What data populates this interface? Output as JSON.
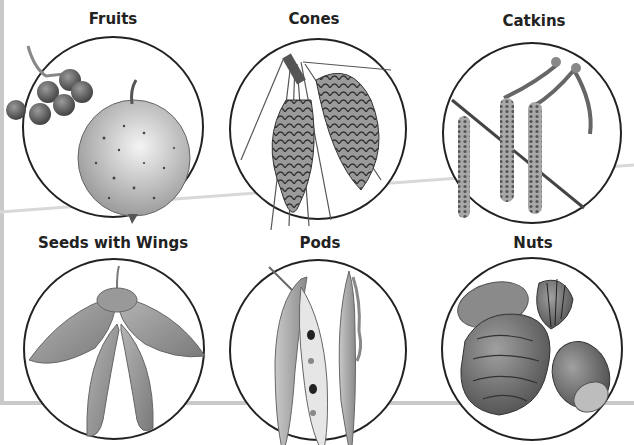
{
  "diagram": {
    "type": "labeled-illustration-grid",
    "layout": {
      "rows": 2,
      "columns": 3
    },
    "panels": [
      {
        "label": "Fruits",
        "contents": "apple and cluster of berries"
      },
      {
        "label": "Cones",
        "contents": "pine cones with needles"
      },
      {
        "label": "Catkins",
        "contents": "hanging catkins on a twig"
      },
      {
        "label": "Seeds with Wings",
        "contents": "maple samaras"
      },
      {
        "label": "Pods",
        "contents": "open and closed bean pods"
      },
      {
        "label": "Nuts",
        "contents": "almond, walnut, hazelnut and chestnut"
      }
    ]
  },
  "colors": {
    "outline": "#222222",
    "frame": "#c9c9c9",
    "illustration": "#8a8a8a"
  }
}
